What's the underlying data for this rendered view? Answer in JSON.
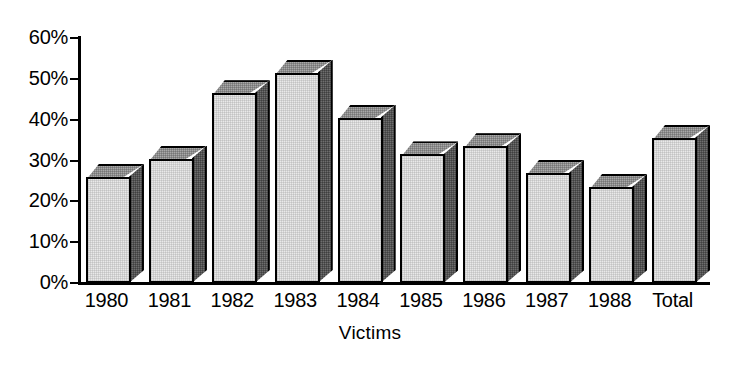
{
  "chart_data": {
    "type": "bar",
    "title": "",
    "subtitle": "",
    "xlabel": "Victims",
    "ylabel": "",
    "categories": [
      "1980",
      "1981",
      "1982",
      "1983",
      "1984",
      "1985",
      "1986",
      "1987",
      "1988",
      "Total"
    ],
    "values": [
      25.5,
      30,
      46,
      51,
      40,
      31,
      33,
      26.5,
      23,
      35
    ],
    "value_format": "percent",
    "ylim": [
      0,
      60
    ],
    "ytick_values": [
      0,
      10,
      20,
      30,
      40,
      50,
      60
    ],
    "ytick_labels": [
      "0%",
      "10%",
      "20%",
      "30%",
      "40%",
      "50%",
      "60%"
    ],
    "grid": false,
    "legend": false,
    "legend_position": "none",
    "style": "3d-column",
    "series": [
      {
        "name": "Victims",
        "values": [
          25.5,
          30,
          46,
          51,
          40,
          31,
          33,
          26.5,
          23,
          35
        ]
      }
    ]
  },
  "colors": {
    "bar_front": "#e9e9e9",
    "bar_top": "#a9a9a9",
    "bar_side": "#6e6e6e",
    "outline": "#000000",
    "background": "#ffffff",
    "text": "#000000"
  }
}
